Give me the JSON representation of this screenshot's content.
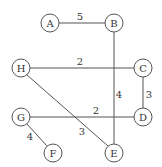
{
  "diagram": {
    "type": "weighted-undirected-graph",
    "nodes": [
      {
        "id": "A",
        "label": "A",
        "x": 50,
        "y": 23
      },
      {
        "id": "B",
        "label": "B",
        "x": 114,
        "y": 23
      },
      {
        "id": "H",
        "label": "H",
        "x": 21,
        "y": 68
      },
      {
        "id": "C",
        "label": "C",
        "x": 143,
        "y": 68
      },
      {
        "id": "G",
        "label": "G",
        "x": 21,
        "y": 117
      },
      {
        "id": "D",
        "label": "D",
        "x": 143,
        "y": 117
      },
      {
        "id": "F",
        "label": "F",
        "x": 53,
        "y": 153
      },
      {
        "id": "E",
        "label": "E",
        "x": 114,
        "y": 153
      }
    ],
    "edges": [
      {
        "from": "A",
        "to": "B",
        "weight": "5",
        "lx": 80,
        "ly": 16
      },
      {
        "from": "H",
        "to": "C",
        "weight": "2",
        "lx": 80,
        "ly": 61
      },
      {
        "from": "B",
        "to": "E",
        "weight": "4",
        "lx": 119,
        "ly": 94
      },
      {
        "from": "C",
        "to": "D",
        "weight": "3",
        "lx": 149,
        "ly": 94
      },
      {
        "from": "G",
        "to": "D",
        "weight": "2",
        "lx": 96,
        "ly": 110
      },
      {
        "from": "H",
        "to": "E",
        "weight": "3",
        "lx": 82,
        "ly": 131
      },
      {
        "from": "G",
        "to": "F",
        "weight": "4",
        "lx": 30,
        "ly": 136
      }
    ],
    "node_radius": 9,
    "colors": {
      "stroke": "#555555",
      "text": "#333333",
      "background": "#ffffff"
    }
  }
}
